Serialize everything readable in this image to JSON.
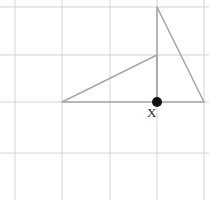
{
  "figure": {
    "type": "geometry-diagram",
    "background_color": "#ffffff",
    "width": 209,
    "height": 200,
    "grid": {
      "visible": true,
      "line_color": "#c9c9c9",
      "line_width": 0.8,
      "vertical_lines_x": [
        15,
        62,
        110,
        157,
        204
      ],
      "horizontal_lines_y": [
        7,
        55,
        102,
        153
      ],
      "cell_size": 47.5
    },
    "shapes": [
      {
        "name": "left-triangle",
        "type": "polygon",
        "stroke_color": "#a8a8a8",
        "stroke_width": 1.6,
        "fill": "none",
        "points": [
          [
            62,
            102
          ],
          [
            157,
            55
          ],
          [
            157,
            102
          ]
        ]
      },
      {
        "name": "right-triangle",
        "type": "polygon",
        "stroke_color": "#a8a8a8",
        "stroke_width": 1.6,
        "fill": "none",
        "points": [
          [
            157,
            7
          ],
          [
            204,
            102
          ],
          [
            157,
            102
          ]
        ]
      }
    ],
    "points": [
      {
        "name": "point-x",
        "label": "X",
        "x": 157,
        "y": 102,
        "radius": 5,
        "color": "#111111",
        "label_x": 147,
        "label_y": 106
      }
    ]
  }
}
